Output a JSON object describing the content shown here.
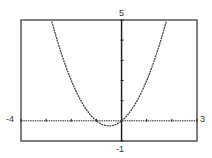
{
  "chart_data": {
    "type": "line",
    "title": "",
    "xlabel": "",
    "ylabel": "",
    "xlim": [
      -4,
      3
    ],
    "ylim": [
      -1,
      5
    ],
    "tick_labels": {
      "xmin": "-4",
      "xmax": "3",
      "ymin": "-1",
      "ymax": "5"
    },
    "grid": false,
    "series": [
      {
        "name": "y = x^2 + x",
        "function": "x^2 + x",
        "x": [
          -2.79,
          -2,
          -1.5,
          -1,
          -0.5,
          0,
          0.5,
          1,
          1.5,
          1.79
        ],
        "values": [
          5,
          2,
          0.75,
          0,
          -0.25,
          0,
          0.75,
          2,
          3.75,
          5
        ]
      }
    ],
    "style": {
      "line": "#444444",
      "axis": "#222222",
      "frame": "#555555"
    }
  }
}
